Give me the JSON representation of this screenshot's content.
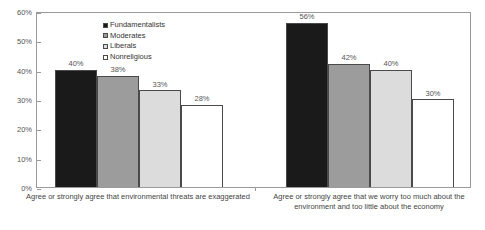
{
  "chart_data": {
    "type": "bar",
    "title": "",
    "subtitle": "",
    "xlabel": "",
    "ylabel": "",
    "ylim": [
      0,
      60
    ],
    "y_ticks": [
      "0%",
      "10%",
      "20%",
      "30%",
      "40%",
      "50%",
      "60%"
    ],
    "y_tick_values": [
      0,
      10,
      20,
      30,
      40,
      50,
      60
    ],
    "grid": false,
    "legend_position": "inside-top-left",
    "value_label_suffix": "%",
    "categories": [
      "Agree or strongly agree that environmental threats are exaggerated",
      "Agree or strongly agree that we worry too much about the environment and too little about the economy"
    ],
    "category_lines": [
      [
        "Agree or strongly agree that environmental threats are exaggerated"
      ],
      [
        "Agree or strongly agree that we worry too much about the",
        "environment and too little about the economy"
      ]
    ],
    "series": [
      {
        "name": "Fundamentalists",
        "color": "#1a1a1a",
        "values": [
          40,
          38
        ]
      },
      {
        "name": "Moderates",
        "color": "#9c9c9c",
        "values": [
          38,
          42
        ]
      },
      {
        "name": "Liberals",
        "color": "#dcdcdc",
        "values": [
          33,
          40
        ]
      },
      {
        "name": "Nonreligious",
        "color": "#ffffff",
        "values": [
          28,
          30
        ]
      }
    ],
    "bar_labels": [
      [
        "40%",
        "38%",
        "33%",
        "28%"
      ],
      [
        "56%",
        "42%",
        "40%",
        "30%"
      ]
    ],
    "bar_values": [
      [
        40,
        38,
        33,
        28
      ],
      [
        56,
        42,
        40,
        30
      ]
    ],
    "axis_color": "#9a9a9a",
    "bar_outline_color": "#4a4a4a",
    "text_color": "#444444",
    "background": "#ffffff"
  }
}
